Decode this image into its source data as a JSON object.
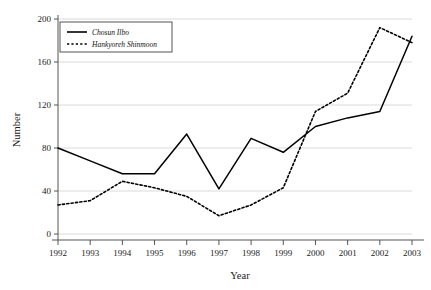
{
  "chart_data": {
    "type": "line",
    "title": "",
    "xlabel": "Year",
    "ylabel": "Number",
    "categories": [
      "1992",
      "1993",
      "1994",
      "1995",
      "1996",
      "1997",
      "1998",
      "1999",
      "2000",
      "2001",
      "2002",
      "2003"
    ],
    "x": [
      1992,
      1993,
      1994,
      1995,
      1996,
      1997,
      1998,
      1999,
      2000,
      2001,
      2002,
      2003
    ],
    "xlim": [
      1992,
      2003
    ],
    "ylim": [
      0,
      200
    ],
    "yticks": [
      0,
      40,
      80,
      120,
      160,
      200
    ],
    "xticks": [
      "1992",
      "1993",
      "1994",
      "1995",
      "1996",
      "1997",
      "1998",
      "1999",
      "2000",
      "2001",
      "2002",
      "2003"
    ],
    "grid": "horizontal",
    "legend_position": "top-left",
    "series": [
      {
        "name": "Chosun Ilbo",
        "style": "solid",
        "color": "#000000",
        "values": [
          80,
          68,
          56,
          56,
          93,
          42,
          89,
          76,
          100,
          108,
          114,
          184
        ]
      },
      {
        "name": "Hankyoreh Shinmoon",
        "style": "dotted",
        "color": "#000000",
        "values": [
          27,
          31,
          49,
          43,
          35,
          17,
          27,
          43,
          114,
          131,
          192,
          178
        ]
      }
    ]
  },
  "axes": {
    "y_title": "Number",
    "x_title": "Year",
    "y_tick_labels": [
      "0",
      "40",
      "80",
      "120",
      "160",
      "200"
    ],
    "x_tick_labels": [
      "1992",
      "1993",
      "1994",
      "1995",
      "1996",
      "1997",
      "1998",
      "1999",
      "2000",
      "2001",
      "2002",
      "2003"
    ]
  },
  "legend": {
    "items": [
      {
        "label": "Chosun Ilbo",
        "style": "solid"
      },
      {
        "label": "Hankyoreh Shinmoon",
        "style": "dotted"
      }
    ]
  },
  "colors": {
    "line": "#000000",
    "grid": "#dadada",
    "axis": "#555555",
    "text": "#1a1a1a",
    "background": "#ffffff"
  }
}
